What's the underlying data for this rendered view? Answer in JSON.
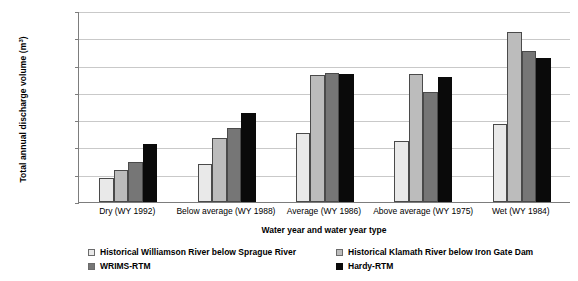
{
  "chart_data": {
    "type": "bar",
    "title": "",
    "xlabel": "Water year and water year type",
    "ylabel": "Total annual discharge volume (m3)",
    "ylabel_main": "Total annual discharge volume (m",
    "ylabel_sup": "3",
    "ylabel_tail": ")",
    "ylim": [
      0,
      3500000
    ],
    "ytick_step": 500000,
    "ytick_labels": [
      "3,500,000",
      "3,000,000",
      "2,500,000",
      "2,000,000",
      "1,500,000",
      "1,000,000",
      "500,000",
      "0"
    ],
    "ytick_values": [
      3500000,
      3000000,
      2500000,
      2000000,
      1500000,
      1000000,
      500000,
      0
    ],
    "grid": true,
    "legend_position": "bottom",
    "categories": [
      "Dry (WY 1992)",
      "Below average (WY 1988)",
      "Average (WY 1986)",
      "Above average (WY 1975)",
      "Wet (WY 1984)"
    ],
    "series": [
      {
        "name": "Historical Williamson River below Sprague River",
        "color": "#e9e9e9",
        "values": [
          440000,
          690000,
          1265000,
          1125000,
          1430000
        ]
      },
      {
        "name": "Historical Klamath River below Iron Gate Dam",
        "color": "#bcbcbc",
        "values": [
          580000,
          1170000,
          2320000,
          2350000,
          3120000
        ]
      },
      {
        "name": "WRIMS-RTM",
        "color": "#767676",
        "values": [
          740000,
          1350000,
          2370000,
          2025000,
          2760000
        ]
      },
      {
        "name": "Hardy-RTM",
        "color": "#0a0a0a",
        "values": [
          1065000,
          1630000,
          2340000,
          2300000,
          2630000
        ]
      }
    ]
  },
  "legend": {
    "items": [
      {
        "label": "Historical Williamson River below Sprague River",
        "color": "#e9e9e9"
      },
      {
        "label": "Historical Klamath River below Iron Gate Dam",
        "color": "#bcbcbc"
      },
      {
        "label": "WRIMS-RTM",
        "color": "#767676"
      },
      {
        "label": "Hardy-RTM",
        "color": "#0a0a0a"
      }
    ]
  }
}
